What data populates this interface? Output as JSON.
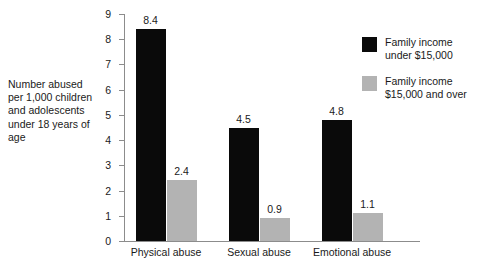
{
  "chart_data": {
    "type": "bar",
    "title": "",
    "subtitle": "",
    "xlabel": "",
    "ylabel": "Number abused\nper 1,000 children\nand adolescents\nunder 18 years of\nage",
    "categories": [
      "Physical abuse",
      "Sexual abuse",
      "Emotional abuse"
    ],
    "series": [
      {
        "name": "Family income\nunder $15,000",
        "color": "#0a0a0a",
        "values": [
          8.4,
          4.5,
          4.8
        ],
        "labels": [
          "8.4",
          "4.5",
          "4.8"
        ]
      },
      {
        "name": "Family income\n$15,000 and over",
        "color": "#b3b3b3",
        "values": [
          2.4,
          0.9,
          1.1
        ],
        "labels": [
          "2.4",
          "0.9",
          "1.1"
        ]
      }
    ],
    "ylim": [
      0,
      9
    ],
    "ytick_labels": [
      "0",
      "1",
      "2",
      "3",
      "4",
      "5",
      "6",
      "7",
      "8",
      "9"
    ],
    "ytick_values": [
      0,
      1,
      2,
      3,
      4,
      5,
      6,
      7,
      8,
      9
    ],
    "grid": false,
    "legend_position": "right"
  },
  "legend": {
    "items": [
      {
        "label": "Family income\nunder $15,000",
        "color": "#0a0a0a",
        "swatch": "dark"
      },
      {
        "label": "Family income\n$15,000 and over",
        "color": "#b3b3b3",
        "swatch": "light"
      }
    ]
  },
  "axis": {
    "caption": "Number abused\nper 1,000 children\nand adolescents\nunder 18 years of\nage"
  },
  "colors": {
    "series_dark": "#0a0a0a",
    "series_light": "#b3b3b3",
    "axis": "#8c8c8c",
    "text": "#1a1a1a",
    "background": "#ffffff"
  }
}
